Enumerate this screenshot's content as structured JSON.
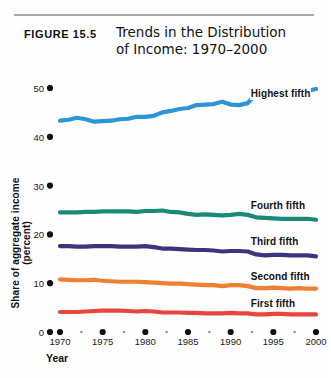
{
  "figure": {
    "number_label": "FIGURE 15.5",
    "title_line1": "Trends in the Distribution",
    "title_line2": "of Income: 1970–2000"
  },
  "chart_data": {
    "type": "line",
    "title": "Trends in the Distribution of Income: 1970–2000",
    "xlabel": "Year",
    "ylabel": "Share of aggregate income (percent)",
    "xlim": [
      1970,
      2000
    ],
    "ylim": [
      0,
      50
    ],
    "yticks": [
      0,
      10,
      20,
      30,
      40,
      50
    ],
    "ytick_labels": [
      "0",
      "10",
      "20",
      "30",
      "40",
      "50"
    ],
    "xticks": [
      1970,
      1975,
      1980,
      1985,
      1990,
      1995,
      2000
    ],
    "xtick_labels": [
      "1970",
      "1975",
      "1980",
      "1985",
      "1990",
      "1995",
      "2000"
    ],
    "x_minor_ticks": [
      1972.5,
      1977.5,
      1982.5,
      1987.5,
      1992.5,
      1997.5
    ],
    "grid": false,
    "legend_position": "inline-right",
    "x": [
      1970,
      1971,
      1972,
      1973,
      1974,
      1975,
      1976,
      1977,
      1978,
      1979,
      1980,
      1981,
      1982,
      1983,
      1984,
      1985,
      1986,
      1987,
      1988,
      1989,
      1990,
      1991,
      1992,
      1993,
      1994,
      1995,
      1996,
      1997,
      1998,
      1999,
      2000
    ],
    "series": [
      {
        "name": "Highest fifth",
        "color": "#2b95d6",
        "label": "Highest fifth",
        "values": [
          43.3,
          43.5,
          43.9,
          43.6,
          43.1,
          43.2,
          43.3,
          43.6,
          43.7,
          44.1,
          44.1,
          44.3,
          45.0,
          45.3,
          45.7,
          45.9,
          46.5,
          46.6,
          46.7,
          47.2,
          46.6,
          46.5,
          46.9,
          48.9,
          49.1,
          48.7,
          49.0,
          49.4,
          49.2,
          49.4,
          49.8
        ]
      },
      {
        "name": "Fourth fifth",
        "color": "#1a8a78",
        "label": "Fourth fifth",
        "values": [
          24.5,
          24.5,
          24.5,
          24.6,
          24.6,
          24.7,
          24.7,
          24.7,
          24.7,
          24.6,
          24.8,
          24.8,
          24.9,
          24.6,
          24.5,
          24.2,
          24.0,
          24.1,
          24.0,
          23.9,
          24.0,
          24.2,
          24.0,
          23.5,
          23.4,
          23.3,
          23.2,
          23.2,
          23.2,
          23.2,
          23.0
        ]
      },
      {
        "name": "Third fifth",
        "color": "#3f3380",
        "label": "Third fifth",
        "values": [
          17.6,
          17.6,
          17.5,
          17.5,
          17.6,
          17.6,
          17.6,
          17.5,
          17.5,
          17.5,
          17.6,
          17.4,
          17.1,
          17.1,
          17.0,
          16.9,
          16.8,
          16.8,
          16.7,
          16.5,
          16.6,
          16.6,
          16.5,
          15.9,
          15.7,
          15.8,
          15.8,
          15.7,
          15.7,
          15.7,
          15.5
        ]
      },
      {
        "name": "Second fifth",
        "color": "#f08030",
        "label": "Second fifth",
        "values": [
          10.8,
          10.7,
          10.6,
          10.6,
          10.7,
          10.5,
          10.4,
          10.3,
          10.3,
          10.3,
          10.2,
          10.1,
          10.0,
          9.9,
          9.9,
          9.8,
          9.7,
          9.6,
          9.6,
          9.4,
          9.6,
          9.6,
          9.4,
          9.0,
          9.0,
          9.1,
          9.0,
          8.9,
          9.0,
          8.9,
          8.9
        ]
      },
      {
        "name": "First fifth",
        "color": "#e8453c",
        "label": "First fifth",
        "values": [
          4.1,
          4.1,
          4.1,
          4.2,
          4.3,
          4.4,
          4.4,
          4.4,
          4.3,
          4.2,
          4.3,
          4.2,
          4.0,
          4.0,
          4.0,
          3.9,
          3.9,
          3.8,
          3.8,
          3.8,
          3.9,
          3.8,
          3.8,
          3.6,
          3.6,
          3.7,
          3.7,
          3.6,
          3.6,
          3.6,
          3.6
        ]
      }
    ]
  },
  "axis": {
    "x_label_text": "Year",
    "y_label_text": "Share of aggregate income (percent)"
  }
}
